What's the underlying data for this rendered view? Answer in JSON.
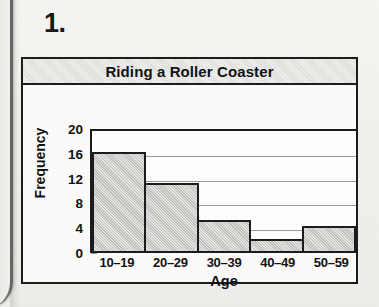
{
  "worksheet": {
    "question_number": "1."
  },
  "chart_data": {
    "type": "bar",
    "title": "Riding a Roller Coaster",
    "xlabel": "Age",
    "ylabel": "Frequency",
    "categories": [
      "10–19",
      "20–29",
      "30–39",
      "40–49",
      "50–59"
    ],
    "values": [
      16,
      11,
      5,
      2,
      4
    ],
    "ylim": [
      0,
      20
    ],
    "yticks": [
      0,
      4,
      8,
      12,
      16,
      20
    ],
    "ytick_labels": [
      "0",
      "4",
      "8",
      "12",
      "16",
      "20"
    ],
    "grid": true,
    "legend": false,
    "colors": {
      "bar_fill": "#c9c9c6",
      "bar_outline": "#1c1c1c",
      "title_band": "#ddddda",
      "gridline": "#9a9a98",
      "page_background": "#f2f1ee"
    }
  }
}
